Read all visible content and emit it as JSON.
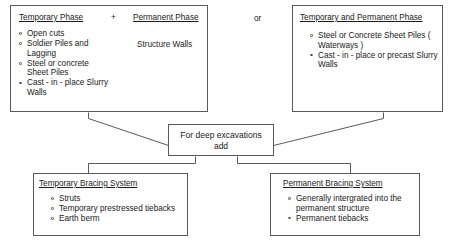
{
  "diagram": {
    "or_label": "or",
    "plus_label": "+",
    "top_left_box": {
      "heading_left": "Temporary Phase",
      "heading_right": "Permanent Phase",
      "right_text": "Structure Walls",
      "items": [
        "Open cuts",
        "Soldier Piles and Lagging",
        "Steel or concrete Sheet Piles",
        "Cast - in - place Slurry Walls"
      ]
    },
    "top_right_box": {
      "heading": "Temporary and Permanent Phase",
      "items": [
        "Steel or Concrete Sheet Piles ( Waterways )",
        "Cast - in - place or precast Slurry Walls"
      ]
    },
    "middle_box": {
      "line1": "For deep excavations",
      "line2": "add"
    },
    "bottom_left_box": {
      "heading": "Temporary Bracing System",
      "items": [
        "Struts",
        "Temporary prestressed tiebacks",
        "Earth berm"
      ]
    },
    "bottom_right_box": {
      "heading": "Permanent Bracing System",
      "items": [
        "Generally intergrated into the permanent structure",
        "Permanent tiebacks"
      ]
    },
    "colors": {
      "stroke": "#5a5a5a",
      "text": "#1a1a1a",
      "background": "#ffffff"
    }
  }
}
